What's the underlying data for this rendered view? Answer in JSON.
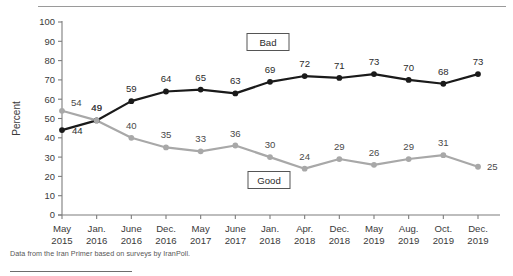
{
  "figure": {
    "footnote": "Data from the Iran Primer based on surveys by IranPoll.",
    "ylabel": "Percent"
  },
  "legend": {
    "bad_label": "Bad",
    "good_label": "Good"
  },
  "colors": {
    "bad_line": "#1a1a1a",
    "good_line": "#a8a8a8",
    "axis": "#7d7d7d",
    "text": "#333333",
    "footnote": "#575757",
    "rule": "#9a9a9a"
  },
  "chart_data": {
    "type": "line",
    "title": "",
    "subtitle": "",
    "xlabel": "",
    "ylabel": "Percent",
    "ylim": [
      0,
      100
    ],
    "yticks": [
      0,
      10,
      20,
      30,
      40,
      50,
      60,
      70,
      80,
      90,
      100
    ],
    "ytick_labels": [
      "0",
      "10",
      "20",
      "30",
      "40",
      "50",
      "60",
      "70",
      "80",
      "90",
      "100"
    ],
    "grid": false,
    "legend_position": "inline-annotation",
    "categories": [
      "May 2015",
      "Jan. 2016",
      "June 2016",
      "Dec. 2016",
      "May 2017",
      "June 2017",
      "Jan. 2018",
      "Apr. 2018",
      "Dec. 2018",
      "May 2019",
      "Aug. 2019",
      "Oct. 2019",
      "Dec. 2019"
    ],
    "xtick_month": [
      "May",
      "Jan.",
      "June",
      "Dec.",
      "May",
      "June",
      "Jan.",
      "Apr.",
      "Dec.",
      "May",
      "Aug.",
      "Oct.",
      "Dec."
    ],
    "xtick_year": [
      "2015",
      "2016",
      "2016",
      "2016",
      "2017",
      "2017",
      "2018",
      "2018",
      "2018",
      "2019",
      "2019",
      "2019",
      "2019"
    ],
    "series": [
      {
        "name": "Bad",
        "color": "#1a1a1a",
        "values": [
          44,
          49,
          59,
          64,
          65,
          63,
          69,
          72,
          71,
          73,
          70,
          68,
          73
        ]
      },
      {
        "name": "Good",
        "color": "#a8a8a8",
        "values": [
          54,
          49,
          40,
          35,
          33,
          36,
          30,
          24,
          29,
          26,
          29,
          31,
          25
        ]
      }
    ],
    "annotations": [
      "Bad",
      "Good"
    ]
  }
}
